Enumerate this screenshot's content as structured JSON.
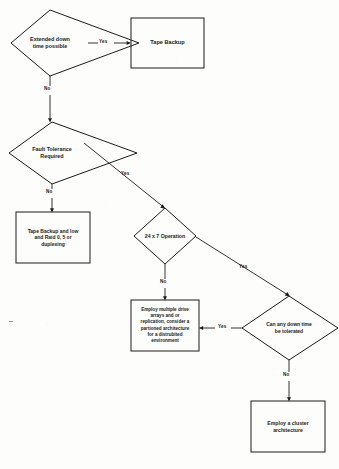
{
  "diagram": {
    "type": "flowchart",
    "background_color": "#fdfdfc",
    "line_color": "#1d1d1d",
    "text_color": "#1a1a1a"
  },
  "nodes": {
    "extended_downtime": {
      "id": "extended_downtime",
      "shape": "decision",
      "label": "Extended down\ntime possible",
      "x": 10,
      "y": 10,
      "w": 130,
      "h": 66,
      "font_size": 5.4
    },
    "tape_backup": {
      "id": "tape_backup",
      "shape": "process",
      "label": "Tape Backup",
      "x": 131,
      "y": 18,
      "w": 73,
      "h": 50,
      "font_size": 5.6
    },
    "fault_tolerance": {
      "id": "fault_tolerance",
      "shape": "decision",
      "label": "Fault Tolerance\nRequired",
      "x": 8,
      "y": 122,
      "w": 130,
      "h": 62,
      "font_size": 5.4
    },
    "tape_raid": {
      "id": "tape_raid",
      "shape": "process",
      "label": "Tape Backup and low\nand Raid 0, 5 or\nduplexing",
      "x": 16,
      "y": 212,
      "w": 74,
      "h": 51,
      "font_size": 5.0
    },
    "operation_247": {
      "id": "operation_247",
      "shape": "decision",
      "label": "24 x 7 Operation",
      "x": 124,
      "y": 208,
      "w": 72,
      "h": 56,
      "font_size": 5.2
    },
    "multi_drive": {
      "id": "multi_drive",
      "shape": "process",
      "label": "Employ multiple drive\narrays and or\nreplication, consider a\npartioned architecture\nfor a distrubited\nenvironment",
      "x": 131,
      "y": 300,
      "w": 68,
      "h": 51,
      "font_size": 4.6
    },
    "downtime_tolerated": {
      "id": "downtime_tolerated",
      "shape": "decision",
      "label": "Can any down time\nbe tolerated",
      "x": 241,
      "y": 296,
      "w": 98,
      "h": 64,
      "font_size": 5.0
    },
    "cluster": {
      "id": "cluster",
      "shape": "process",
      "label": "Employ a cluster\narchitecture",
      "x": 251,
      "y": 401,
      "w": 74,
      "h": 51,
      "font_size": 5.2
    }
  },
  "edges": [
    {
      "id": "edge-extended-yes",
      "from": "extended_downtime",
      "to": "tape_backup",
      "label": "Yes",
      "label_x": 100,
      "label_y": 39,
      "path": "M 140 43 L 131 43",
      "dash_before": "M 89 43 L 98 43",
      "dash_after": "M 116 43 L 129 43",
      "arrow_at": "131,43",
      "arrow_dir": "right"
    },
    {
      "id": "edge-extended-no",
      "from": "extended_downtime",
      "to": "fault_tolerance",
      "label": "No",
      "label_x": 47,
      "label_y": 90,
      "path": "M 75 76 L 75 122",
      "arrow_at": "75,122",
      "arrow_dir": "down"
    },
    {
      "id": "edge-fault-no",
      "from": "fault_tolerance",
      "to": "tape_raid",
      "label": "No",
      "label_x": 46,
      "label_y": 185,
      "path": "M 53 184 L 53 212",
      "arrow_at": "53,212",
      "arrow_dir": "down"
    },
    {
      "id": "edge-fault-yes",
      "from": "fault_tolerance",
      "to": "operation_247",
      "label": "Yes",
      "label_x": 122,
      "label_y": 172,
      "path": "M 82 142 L 165 208",
      "arrow_at": "165,208",
      "arrow_dir": "diag-down-right"
    },
    {
      "id": "edge-247-no",
      "from": "operation_247",
      "to": "multi_drive",
      "label": "No",
      "label_x": 160,
      "label_y": 280,
      "path": "M 166 264 L 166 300",
      "arrow_at": "166,300",
      "arrow_dir": "down"
    },
    {
      "id": "edge-247-yes",
      "from": "operation_247",
      "to": "downtime_tolerated",
      "label": "Yes",
      "label_x": 240,
      "label_y": 265,
      "path": "M 196 236 L 289 296",
      "arrow_at": "289,296",
      "arrow_dir": "diag-down-right"
    },
    {
      "id": "edge-downtime-yes",
      "from": "downtime_tolerated",
      "to": "multi_drive",
      "label": "Yes",
      "label_x": 222,
      "label_y": 324,
      "path": "M 241 328 L 199 328",
      "arrow_at": "199,328",
      "arrow_dir": "left"
    },
    {
      "id": "edge-downtime-no",
      "from": "downtime_tolerated",
      "to": "cluster",
      "label": "No",
      "label_x": 283,
      "label_y": 375,
      "path": "M 289 360 L 289 401",
      "arrow_at": "289,401",
      "arrow_dir": "down"
    }
  ]
}
